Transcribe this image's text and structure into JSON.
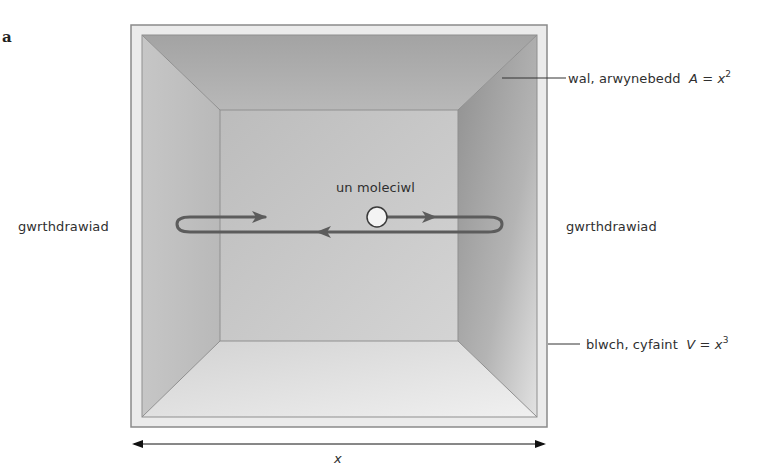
{
  "panel": {
    "letter": "a"
  },
  "labels": {
    "molecule": "un moleciwl",
    "collision_left": "gwrthdrawiad",
    "collision_right": "gwrthdrawiad",
    "wall": {
      "text": "wal, arwynebedd",
      "var": "A",
      "eq": " = ",
      "base": "x",
      "exp": "2"
    },
    "box": {
      "text": "blwch, cyfaint",
      "var": "V",
      "eq": " = ",
      "base": "x",
      "exp": "3"
    },
    "dimension": "x"
  },
  "colors": {
    "frame_light": "#e6e6e6",
    "frame_border": "#8c8c8c",
    "top_face": "#a9a9a9",
    "left_face": "#bdbdbd",
    "right_face": "#9d9d9d",
    "back_wall": "#c4c4c4",
    "floor": "#dedede",
    "path": "#5a5a5a"
  }
}
